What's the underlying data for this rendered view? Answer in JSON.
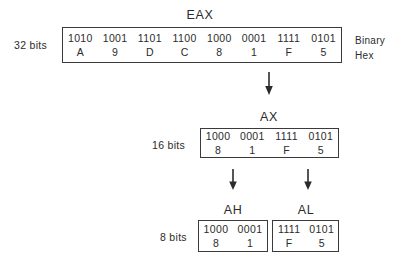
{
  "registers": {
    "eax": {
      "title": "EAX",
      "size_label": "32 bits",
      "nibbles": [
        {
          "binary": "1010",
          "hex": "A"
        },
        {
          "binary": "1001",
          "hex": "9"
        },
        {
          "binary": "1101",
          "hex": "D"
        },
        {
          "binary": "1100",
          "hex": "C"
        },
        {
          "binary": "1000",
          "hex": "8"
        },
        {
          "binary": "0001",
          "hex": "1"
        },
        {
          "binary": "1111",
          "hex": "F"
        },
        {
          "binary": "0101",
          "hex": "5"
        }
      ]
    },
    "ax": {
      "title": "AX",
      "size_label": "16 bits",
      "nibbles": [
        {
          "binary": "1000",
          "hex": "8"
        },
        {
          "binary": "0001",
          "hex": "1"
        },
        {
          "binary": "1111",
          "hex": "F"
        },
        {
          "binary": "0101",
          "hex": "5"
        }
      ]
    },
    "ah": {
      "title": "AH",
      "size_label": "8 bits",
      "nibbles": [
        {
          "binary": "1000",
          "hex": "8"
        },
        {
          "binary": "0001",
          "hex": "1"
        }
      ]
    },
    "al": {
      "title": "AL",
      "nibbles": [
        {
          "binary": "1111",
          "hex": "F"
        },
        {
          "binary": "0101",
          "hex": "5"
        }
      ]
    }
  },
  "legend": {
    "binary_label": "Binary",
    "hex_label": "Hex"
  },
  "arrows": [
    {
      "name": "eax-to-ax-arrow"
    },
    {
      "name": "ax-to-ah-arrow"
    },
    {
      "name": "ax-to-al-arrow"
    }
  ],
  "colors": {
    "background": "#ffffff",
    "border": "#3a3a3a",
    "text": "#2b2b2b"
  }
}
